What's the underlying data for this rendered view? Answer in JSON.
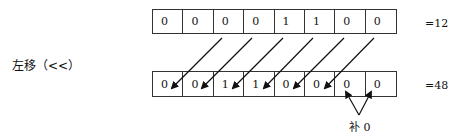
{
  "operation_label": "左移（<<）",
  "top_row": {
    "bits": [
      "0",
      "0",
      "0",
      "0",
      "1",
      "1",
      "0",
      "0"
    ],
    "result": "=12"
  },
  "bottom_row": {
    "bits": [
      "0",
      "0",
      "1",
      "1",
      "0",
      "0",
      "0",
      "0"
    ],
    "result": "=48"
  },
  "fill_annotation": "补 0"
}
